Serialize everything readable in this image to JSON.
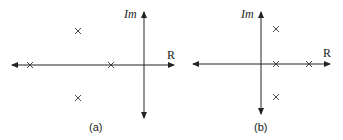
{
  "diagrams": [
    {
      "id": "a",
      "caption": "(a)",
      "imag_axis_label": "Im",
      "real_axis_label": "R",
      "poles": [
        {
          "label": "pole-far-left-real"
        },
        {
          "label": "pole-near-origin-real"
        },
        {
          "label": "pole-upper-complex"
        },
        {
          "label": "pole-lower-complex"
        }
      ]
    },
    {
      "id": "b",
      "caption": "(b)",
      "imag_axis_label": "Im",
      "real_axis_label": "R",
      "poles": [
        {
          "label": "pole-upper-complex"
        },
        {
          "label": "pole-near-origin-real"
        },
        {
          "label": "pole-right-real"
        },
        {
          "label": "pole-lower-complex"
        }
      ]
    }
  ],
  "colors": {
    "line": "#222222",
    "background": "#ffffff"
  }
}
